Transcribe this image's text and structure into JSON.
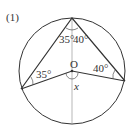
{
  "problem": {
    "number": "(1)"
  },
  "diagram": {
    "center_label": "O",
    "unknown_label": "x",
    "angles": {
      "top_left": "35°",
      "top_right": "40°",
      "left": "35°",
      "right": "40°"
    },
    "colors": {
      "line": "#333333",
      "axis": "#888888"
    }
  }
}
